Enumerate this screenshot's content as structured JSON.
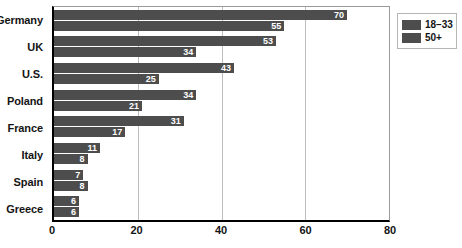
{
  "chart_data": {
    "type": "bar",
    "orientation": "horizontal",
    "title": "",
    "subtitle": "",
    "xlabel": "",
    "ylabel": "",
    "xlim": [
      0,
      80
    ],
    "xticks": [
      "0",
      "20",
      "40",
      "60",
      "80"
    ],
    "xtick_values": [
      0,
      20,
      40,
      60,
      80
    ],
    "grid": "vertical",
    "legend_position": "right-top",
    "categories": [
      "Germany",
      "UK",
      "U.S.",
      "Poland",
      "France",
      "Italy",
      "Spain",
      "Greece"
    ],
    "series": [
      {
        "name": "18–33",
        "color": "#4d4d4d",
        "values": [
          70,
          53,
          43,
          34,
          31,
          11,
          7,
          6
        ]
      },
      {
        "name": "50+",
        "color": "#4d4d4d",
        "values": [
          55,
          34,
          25,
          21,
          17,
          8,
          8,
          6
        ]
      }
    ]
  },
  "legend": {
    "items": [
      {
        "label": "18–33",
        "color": "#4d4d4d"
      },
      {
        "label": "50+",
        "color": "#4d4d4d"
      }
    ]
  }
}
